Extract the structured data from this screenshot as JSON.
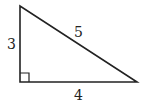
{
  "diagram": {
    "type": "right-triangle",
    "labels": {
      "vertical_leg": "3",
      "hypotenuse": "5",
      "horizontal_leg": "4"
    },
    "right_angle_marker": true,
    "colors": {
      "stroke": "#222222",
      "background": "#ffffff"
    }
  }
}
